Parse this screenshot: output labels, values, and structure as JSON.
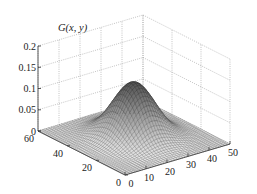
{
  "chart_data": {
    "type": "surface3d",
    "title": "",
    "zlabel": "G(x, y)",
    "xlabel": "",
    "ylabel": "",
    "x_ticks": [
      0,
      10,
      20,
      30,
      40,
      50
    ],
    "y_ticks": [
      0,
      20,
      40,
      60
    ],
    "z_ticks": [
      0,
      0.05,
      0.1,
      0.15,
      0.2
    ],
    "x_tick_labels": [
      "0",
      "10",
      "20",
      "30",
      "40",
      "50"
    ],
    "y_tick_labels": [
      "0",
      "20",
      "40",
      "60"
    ],
    "z_tick_labels": [
      "0",
      "0.05",
      "0.1",
      "0.15",
      "0.2"
    ],
    "xlim": [
      0,
      50
    ],
    "ylim": [
      0,
      60
    ],
    "zlim": [
      0,
      0.2
    ],
    "grid": true,
    "surface": {
      "function": "2D Gaussian",
      "peak_x": 25,
      "peak_y": 30,
      "peak_value": 0.13,
      "sigma_x": 8,
      "sigma_y": 10,
      "mesh": "wireframe",
      "colormap": "gray"
    }
  }
}
